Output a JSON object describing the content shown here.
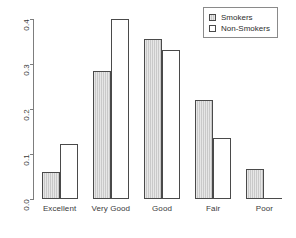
{
  "chart_data": {
    "type": "bar",
    "title": "",
    "subtitle": "",
    "xlabel": "",
    "ylabel": "",
    "categories": [
      "Excellent",
      "Very Good",
      "Good",
      "Fair",
      "Poor"
    ],
    "series": [
      {
        "name": "Smokers",
        "color": "#c9c9c9",
        "values": [
          0.061,
          0.285,
          0.356,
          0.221,
          0.067
        ]
      },
      {
        "name": "Non-Smokers",
        "color": "#ffffff",
        "values": [
          0.122,
          0.4,
          0.332,
          0.135,
          0.002
        ]
      }
    ],
    "ylim": [
      0.0,
      0.4
    ],
    "yticks": [
      0.0,
      0.1,
      0.2,
      0.3,
      0.4
    ],
    "ytick_labels": [
      "0.0",
      "0.1",
      "0.2",
      "0.3",
      "0.4"
    ],
    "grid": false,
    "legend_position": "top-right",
    "legend_entries": [
      "Smokers",
      "Non-Smokers"
    ]
  },
  "legend": {
    "items": [
      {
        "label": "Smokers",
        "swatch": "filled-square-icon"
      },
      {
        "label": "Non-Smokers",
        "swatch": "empty-square-icon"
      }
    ]
  },
  "axes": {
    "y": {
      "tick_labels": [
        "0.0",
        "0.1",
        "0.2",
        "0.3",
        "0.4"
      ],
      "values": [
        0.0,
        0.1,
        0.2,
        0.3,
        0.4
      ]
    },
    "x": {
      "tick_labels": [
        "Excellent",
        "Very Good",
        "Good",
        "Fair",
        "Poor"
      ]
    }
  }
}
